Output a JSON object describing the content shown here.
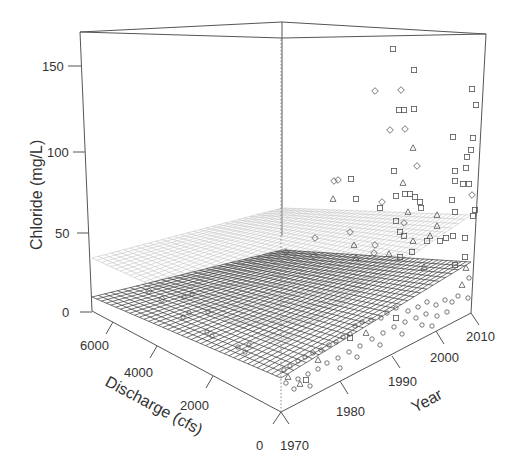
{
  "chart_data": {
    "type": "scatter3d",
    "title": "",
    "zlabel": "Chloride (mg/L)",
    "xlabel": "Discharge (cfs)",
    "ylabel": "Year",
    "z_ticks": [
      "0",
      "50",
      "100",
      "150"
    ],
    "x_ticks": [
      "0",
      "2000",
      "4000",
      "6000"
    ],
    "y_ticks": [
      "1970",
      "1980",
      "1990",
      "2000",
      "2010"
    ],
    "zlim": [
      0,
      170
    ],
    "xlim": [
      0,
      7000
    ],
    "ylim": [
      1970,
      2012
    ],
    "surfaces": [
      {
        "name": "fitted-surface",
        "style": "dark mesh",
        "color": "#333333"
      },
      {
        "name": "upper-surface",
        "style": "light mesh",
        "color": "#bbbbbb"
      }
    ],
    "marker_types": [
      "circle",
      "triangle",
      "diamond",
      "square"
    ],
    "points": [
      {
        "marker": "square",
        "px": 393,
        "py": 49
      },
      {
        "marker": "square",
        "px": 414,
        "py": 70
      },
      {
        "marker": "diamond",
        "px": 375,
        "py": 91
      },
      {
        "marker": "diamond",
        "px": 401,
        "py": 90
      },
      {
        "marker": "square",
        "px": 472,
        "py": 89
      },
      {
        "marker": "square",
        "px": 476,
        "py": 105
      },
      {
        "marker": "square",
        "px": 399,
        "py": 110
      },
      {
        "marker": "square",
        "px": 404,
        "py": 110
      },
      {
        "marker": "square",
        "px": 414,
        "py": 109
      },
      {
        "marker": "diamond",
        "px": 390,
        "py": 130
      },
      {
        "marker": "diamond",
        "px": 405,
        "py": 129
      },
      {
        "marker": "square",
        "px": 453,
        "py": 137
      },
      {
        "marker": "square",
        "px": 473,
        "py": 138
      },
      {
        "marker": "triangle",
        "px": 413,
        "py": 148
      },
      {
        "marker": "square",
        "px": 471,
        "py": 150
      },
      {
        "marker": "square",
        "px": 467,
        "py": 157
      },
      {
        "marker": "diamond",
        "px": 417,
        "py": 166
      },
      {
        "marker": "square",
        "px": 394,
        "py": 171
      },
      {
        "marker": "square",
        "px": 455,
        "py": 171
      },
      {
        "marker": "square",
        "px": 466,
        "py": 168
      },
      {
        "marker": "diamond",
        "px": 334,
        "py": 181
      },
      {
        "marker": "diamond",
        "px": 338,
        "py": 180
      },
      {
        "marker": "square",
        "px": 351,
        "py": 179
      },
      {
        "marker": "triangle",
        "px": 403,
        "py": 183
      },
      {
        "marker": "square",
        "px": 455,
        "py": 181
      },
      {
        "marker": "square",
        "px": 463,
        "py": 184
      },
      {
        "marker": "square",
        "px": 469,
        "py": 184
      },
      {
        "marker": "triangle",
        "px": 333,
        "py": 199
      },
      {
        "marker": "square",
        "px": 356,
        "py": 199
      },
      {
        "marker": "diamond",
        "px": 382,
        "py": 202
      },
      {
        "marker": "square",
        "px": 380,
        "py": 208
      },
      {
        "marker": "square",
        "px": 396,
        "py": 196
      },
      {
        "marker": "square",
        "px": 405,
        "py": 194
      },
      {
        "marker": "square",
        "px": 410,
        "py": 194
      },
      {
        "marker": "square",
        "px": 415,
        "py": 197
      },
      {
        "marker": "square",
        "px": 420,
        "py": 202
      },
      {
        "marker": "square",
        "px": 452,
        "py": 200
      },
      {
        "marker": "diamond",
        "px": 472,
        "py": 195
      },
      {
        "marker": "triangle",
        "px": 408,
        "py": 212
      },
      {
        "marker": "square",
        "px": 421,
        "py": 208
      },
      {
        "marker": "triangle",
        "px": 437,
        "py": 215
      },
      {
        "marker": "square",
        "px": 455,
        "py": 212
      },
      {
        "marker": "square",
        "px": 475,
        "py": 210
      },
      {
        "marker": "square",
        "px": 396,
        "py": 221
      },
      {
        "marker": "diamond",
        "px": 404,
        "py": 223
      },
      {
        "marker": "triangle",
        "px": 437,
        "py": 226
      },
      {
        "marker": "square",
        "px": 473,
        "py": 216
      },
      {
        "marker": "diamond",
        "px": 350,
        "py": 232
      },
      {
        "marker": "square",
        "px": 400,
        "py": 232
      },
      {
        "marker": "triangle",
        "px": 430,
        "py": 236
      },
      {
        "marker": "diamond",
        "px": 315,
        "py": 238
      },
      {
        "marker": "square",
        "px": 404,
        "py": 236
      },
      {
        "marker": "triangle",
        "px": 413,
        "py": 241
      },
      {
        "marker": "triangle",
        "px": 354,
        "py": 245
      },
      {
        "marker": "diamond",
        "px": 375,
        "py": 245
      },
      {
        "marker": "square",
        "px": 427,
        "py": 241
      },
      {
        "marker": "square",
        "px": 440,
        "py": 241
      },
      {
        "marker": "square",
        "px": 446,
        "py": 238
      },
      {
        "marker": "square",
        "px": 453,
        "py": 236
      },
      {
        "marker": "square",
        "px": 465,
        "py": 238
      },
      {
        "marker": "diamond",
        "px": 286,
        "py": 252
      },
      {
        "marker": "diamond",
        "px": 314,
        "py": 256
      },
      {
        "marker": "triangle",
        "px": 356,
        "py": 258
      },
      {
        "marker": "diamond",
        "px": 374,
        "py": 253
      },
      {
        "marker": "triangle",
        "px": 389,
        "py": 254
      },
      {
        "marker": "square",
        "px": 400,
        "py": 257
      },
      {
        "marker": "square",
        "px": 412,
        "py": 252
      },
      {
        "marker": "square",
        "px": 465,
        "py": 257
      },
      {
        "marker": "triangle",
        "px": 424,
        "py": 267
      },
      {
        "marker": "square",
        "px": 455,
        "py": 265
      },
      {
        "marker": "triangle",
        "px": 466,
        "py": 268
      },
      {
        "marker": "circle",
        "px": 469,
        "py": 278
      },
      {
        "marker": "triangle",
        "px": 462,
        "py": 285
      },
      {
        "marker": "circle",
        "px": 458,
        "py": 296
      },
      {
        "marker": "circle",
        "px": 468,
        "py": 298
      },
      {
        "marker": "circle",
        "px": 452,
        "py": 302
      },
      {
        "marker": "circle",
        "px": 445,
        "py": 300
      },
      {
        "marker": "circle",
        "px": 436,
        "py": 305
      },
      {
        "marker": "circle",
        "px": 427,
        "py": 302
      },
      {
        "marker": "circle",
        "px": 418,
        "py": 307
      },
      {
        "marker": "circle",
        "px": 408,
        "py": 311
      },
      {
        "marker": "circle",
        "px": 396,
        "py": 308
      },
      {
        "marker": "circle",
        "px": 387,
        "py": 313
      },
      {
        "marker": "circle",
        "px": 381,
        "py": 318
      },
      {
        "marker": "circle",
        "px": 371,
        "py": 320
      },
      {
        "marker": "circle",
        "px": 362,
        "py": 322
      },
      {
        "marker": "circle",
        "px": 355,
        "py": 326
      },
      {
        "marker": "triangle",
        "px": 366,
        "py": 333
      },
      {
        "marker": "circle",
        "px": 350,
        "py": 334
      },
      {
        "marker": "circle",
        "px": 343,
        "py": 337
      },
      {
        "marker": "circle",
        "px": 336,
        "py": 342
      },
      {
        "marker": "circle",
        "px": 329,
        "py": 345
      },
      {
        "marker": "circle",
        "px": 321,
        "py": 350
      },
      {
        "marker": "circle",
        "px": 313,
        "py": 353
      },
      {
        "marker": "circle",
        "px": 305,
        "py": 357
      },
      {
        "marker": "circle",
        "px": 298,
        "py": 361
      },
      {
        "marker": "triangle",
        "px": 318,
        "py": 360
      },
      {
        "marker": "circle",
        "px": 290,
        "py": 366
      },
      {
        "marker": "circle",
        "px": 284,
        "py": 370
      },
      {
        "marker": "triangle",
        "px": 288,
        "py": 377
      },
      {
        "marker": "circle",
        "px": 298,
        "py": 379
      },
      {
        "marker": "circle",
        "px": 308,
        "py": 374
      },
      {
        "marker": "circle",
        "px": 318,
        "py": 369
      },
      {
        "marker": "circle",
        "px": 327,
        "py": 363
      },
      {
        "marker": "circle",
        "px": 338,
        "py": 358
      },
      {
        "marker": "circle",
        "px": 349,
        "py": 352
      },
      {
        "marker": "circle",
        "px": 360,
        "py": 346
      },
      {
        "marker": "circle",
        "px": 372,
        "py": 339
      },
      {
        "marker": "circle",
        "px": 383,
        "py": 333
      },
      {
        "marker": "circle",
        "px": 394,
        "py": 327
      },
      {
        "marker": "circle",
        "px": 405,
        "py": 322
      },
      {
        "marker": "circle",
        "px": 416,
        "py": 318
      },
      {
        "marker": "circle",
        "px": 426,
        "py": 314
      },
      {
        "marker": "circle",
        "px": 437,
        "py": 316
      },
      {
        "marker": "circle",
        "px": 447,
        "py": 312
      },
      {
        "marker": "circle",
        "px": 310,
        "py": 386
      },
      {
        "marker": "circle",
        "px": 294,
        "py": 389
      },
      {
        "marker": "circle",
        "px": 340,
        "py": 368
      },
      {
        "marker": "circle",
        "px": 357,
        "py": 357
      },
      {
        "marker": "circle",
        "px": 380,
        "py": 345
      },
      {
        "marker": "circle",
        "px": 402,
        "py": 334
      },
      {
        "marker": "circle",
        "px": 422,
        "py": 325
      },
      {
        "marker": "circle",
        "px": 432,
        "py": 326
      },
      {
        "marker": "circle",
        "px": 286,
        "py": 383
      },
      {
        "marker": "triangle",
        "px": 300,
        "py": 384
      },
      {
        "marker": "square",
        "px": 306,
        "py": 380
      },
      {
        "marker": "square",
        "px": 350,
        "py": 338
      },
      {
        "marker": "square",
        "px": 396,
        "py": 318
      },
      {
        "marker": "diamond",
        "px": 149,
        "py": 291
      },
      {
        "marker": "diamond",
        "px": 162,
        "py": 299
      },
      {
        "marker": "circle",
        "px": 184,
        "py": 297
      },
      {
        "marker": "circle",
        "px": 192,
        "py": 294
      },
      {
        "marker": "circle",
        "px": 183,
        "py": 317
      },
      {
        "marker": "circle",
        "px": 189,
        "py": 313
      },
      {
        "marker": "circle",
        "px": 208,
        "py": 312
      },
      {
        "marker": "circle",
        "px": 207,
        "py": 332
      },
      {
        "marker": "circle",
        "px": 212,
        "py": 336
      },
      {
        "marker": "circle",
        "px": 238,
        "py": 347
      },
      {
        "marker": "circle",
        "px": 245,
        "py": 352
      },
      {
        "marker": "circle",
        "px": 249,
        "py": 345
      }
    ]
  },
  "axes": {
    "z": {
      "title": "Chloride (mg/L)",
      "ticks": [
        "150",
        "100",
        "50",
        "0"
      ]
    },
    "x": {
      "title": "Discharge (cfs)",
      "ticks": [
        "6000",
        "4000",
        "2000",
        "0"
      ]
    },
    "y": {
      "title": "Year",
      "ticks": [
        "1970",
        "1980",
        "1990",
        "2000",
        "2010"
      ]
    }
  },
  "colors": {
    "box": "#555555",
    "text": "#333333",
    "dark_mesh": "#3a3a3a",
    "light_mesh": "#bdbdbd",
    "marker": "#555555"
  }
}
